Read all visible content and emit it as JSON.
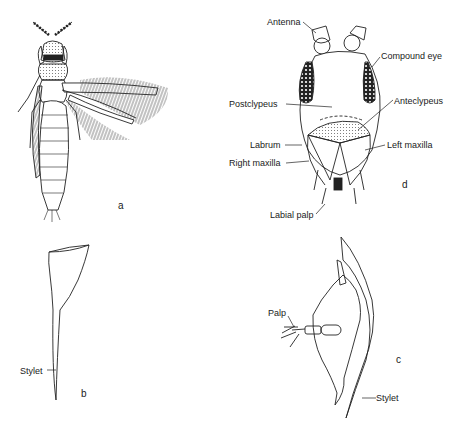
{
  "figure": {
    "panels": [
      {
        "id": "a",
        "letter": "a",
        "subject": "adult-thrips-dorsal"
      },
      {
        "id": "b",
        "letter": "b",
        "subject": "mandibular-stylet"
      },
      {
        "id": "c",
        "letter": "c",
        "subject": "maxilla-with-stylet"
      },
      {
        "id": "d",
        "letter": "d",
        "subject": "head-frontal"
      }
    ],
    "labels": {
      "antenna": "Antenna",
      "compound_eye": "Compound eye",
      "postclypeus": "Postclypeus",
      "anteclypeus": "Anteclypeus",
      "labrum": "Labrum",
      "left_maxilla": "Left maxilla",
      "right_maxilla": "Right maxilla",
      "labial_palp": "Labial palp",
      "stylet_b": "Stylet",
      "palp": "Palp",
      "stylet_c": "Stylet"
    }
  }
}
